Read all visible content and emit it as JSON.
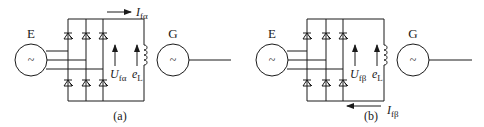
{
  "diagram": {
    "type": "circuit",
    "panels": [
      {
        "id": "a",
        "caption": "(a)",
        "exciter_label": "E",
        "exciter_symbol": "~",
        "generator_label": "G",
        "generator_symbol": "~",
        "voltage_label": {
          "main": "U",
          "sub": "fα"
        },
        "emf_label": {
          "main": "e",
          "sub": "L"
        },
        "current_label": {
          "main": "I",
          "sub": "fα"
        },
        "current_arrow_position": "top",
        "current_arrow_direction": "right"
      },
      {
        "id": "b",
        "caption": "(b)",
        "exciter_label": "E",
        "exciter_symbol": "~",
        "generator_label": "G",
        "generator_symbol": "~",
        "voltage_label": {
          "main": "U",
          "sub": "fβ"
        },
        "emf_label": {
          "main": "e",
          "sub": "L"
        },
        "current_label": {
          "main": "I",
          "sub": "fβ"
        },
        "current_arrow_position": "bottom",
        "current_arrow_direction": "left"
      }
    ],
    "colors": {
      "line": "#1a1a1a",
      "background": "#ffffff"
    }
  }
}
